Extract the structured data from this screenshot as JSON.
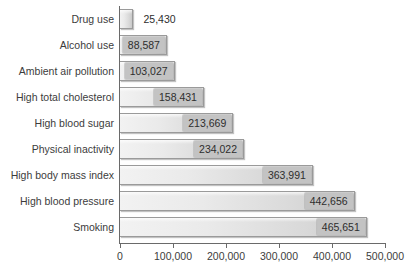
{
  "chart_data": {
    "type": "bar",
    "orientation": "horizontal",
    "title": "",
    "subtitle": "",
    "xlabel": "",
    "ylabel": "",
    "xlim": [
      0,
      500000
    ],
    "grid": false,
    "legend": false,
    "xticks": [
      0,
      100000,
      200000,
      300000,
      400000,
      500000
    ],
    "xtick_labels": [
      "0",
      "100,000",
      "200,000",
      "300,000",
      "400,000",
      "500,000"
    ],
    "categories": [
      "Drug use",
      "Alcohol use",
      "Ambient air pollution",
      "High total cholesterol",
      "High blood sugar",
      "Physical inactivity",
      "High body mass index",
      "High blood pressure",
      "Smoking"
    ],
    "values": [
      25430,
      88587,
      103027,
      158431,
      213669,
      234022,
      363991,
      442656,
      465651
    ],
    "value_labels": [
      "25,430",
      "88,587",
      "103,027",
      "158,431",
      "213,669",
      "234,022",
      "363,991",
      "442,656",
      "465,651"
    ],
    "colors": {
      "bar_light": "#f2f2f2",
      "bar_dark": "#c9c9c9",
      "bar_border": "#9a9a9a",
      "label_box": "#c3c3c3",
      "text": "#3c3c3c",
      "axis": "#6a6a6a",
      "background": "#ffffff"
    }
  }
}
